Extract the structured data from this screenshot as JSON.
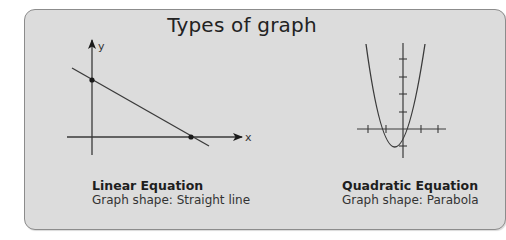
{
  "title": "Types of graph",
  "colors": {
    "panel_fill": "#dcdcdc",
    "panel_border": "#8c8c8c",
    "line": "#3a3a3a",
    "text": "#222222"
  },
  "graphs": [
    {
      "name": "Linear Equation",
      "caption_title": "Linear Equation",
      "caption_sub": "Graph shape: Straight line",
      "axis_labels": {
        "x": "x",
        "y": "y"
      }
    },
    {
      "name": "Quadratic Equation",
      "caption_title": "Quadratic Equation",
      "caption_sub": "Graph shape: Parabola"
    }
  ]
}
